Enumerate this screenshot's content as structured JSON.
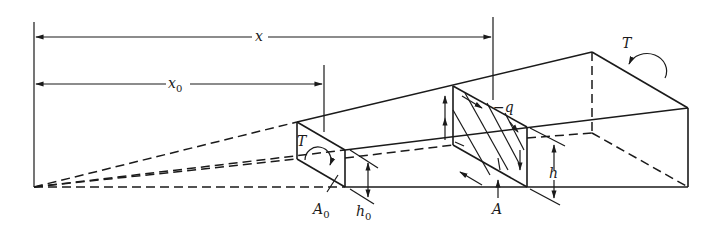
{
  "figure": {
    "labels": {
      "x": "x",
      "x0": "x",
      "x0_sub": "0",
      "T_left": "T",
      "T_right": "T",
      "q": "−q",
      "h": "h",
      "h0": "h",
      "h0_sub": "0",
      "A": "A",
      "A0": "A",
      "A0_sub": "0"
    }
  }
}
